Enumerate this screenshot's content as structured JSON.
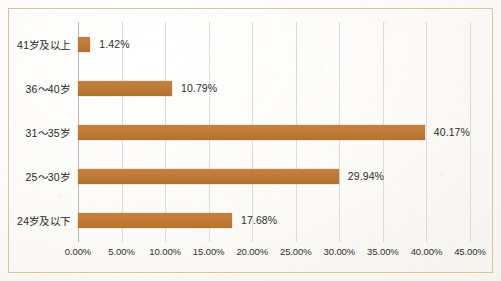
{
  "chart_data": {
    "type": "bar",
    "orientation": "horizontal",
    "title": "",
    "xlabel": "",
    "ylabel": "",
    "categories": [
      "24岁及以下",
      "25～30岁",
      "31～35岁",
      "36～40岁",
      "41岁及以上"
    ],
    "values": [
      17.68,
      29.94,
      40.17,
      10.79,
      1.42
    ],
    "value_labels": [
      "17.68%",
      "29.94%",
      "40.17%",
      "10.79%",
      "1.42%"
    ],
    "xlim": [
      0,
      45
    ],
    "xticks": [
      0,
      5,
      10,
      15,
      20,
      25,
      30,
      35,
      40,
      45
    ],
    "xtick_labels": [
      "0.00%",
      "5.00%",
      "10.00%",
      "15.00%",
      "20.00%",
      "25.00%",
      "30.00%",
      "35.00%",
      "40.00%",
      "45.00%"
    ],
    "grid": "vertical",
    "legend": "none",
    "bar_color": "#bd7a37",
    "gridline_color": "#dcdcdc",
    "axis_color": "#b9b9b9",
    "text_color": "#2e2e2e",
    "frame_color": "#d9c3a0",
    "background_color": "#fbfaf7"
  }
}
